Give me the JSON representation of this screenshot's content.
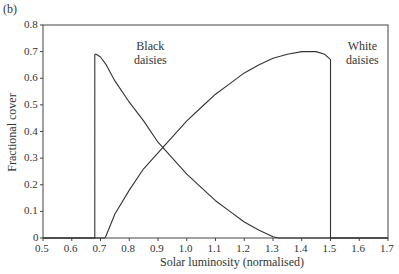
{
  "panel_label": "(b)",
  "chart_data": {
    "type": "line",
    "title": "",
    "xlabel": "Solar luminosity (normalised)",
    "ylabel": "Fractional cover",
    "xlim": [
      0.5,
      1.7
    ],
    "ylim": [
      0,
      0.8
    ],
    "xticks": [
      "0.5",
      "0.6",
      "0.7",
      "0.8",
      "0.9",
      "1.0",
      "1.1",
      "1.2",
      "1.3",
      "1.4",
      "1.5",
      "1.6",
      "1.7"
    ],
    "yticks": [
      "0",
      "0.1",
      "0.2",
      "0.3",
      "0.4",
      "0.5",
      "0.6",
      "0.7",
      "0.8"
    ],
    "grid": false,
    "legend": "inline annotations",
    "series": [
      {
        "name": "Black daisies",
        "x": [
          0.5,
          0.68,
          0.68,
          0.685,
          0.7,
          0.72,
          0.75,
          0.8,
          0.85,
          0.9,
          0.95,
          1.0,
          1.05,
          1.1,
          1.15,
          1.2,
          1.25,
          1.3,
          1.32,
          1.7
        ],
        "y": [
          0,
          0,
          0.69,
          0.69,
          0.68,
          0.65,
          0.59,
          0.51,
          0.44,
          0.36,
          0.3,
          0.24,
          0.19,
          0.14,
          0.1,
          0.06,
          0.03,
          0.005,
          0,
          0
        ]
      },
      {
        "name": "White daisies",
        "x": [
          0.5,
          0.715,
          0.72,
          0.75,
          0.8,
          0.85,
          0.9,
          0.95,
          1.0,
          1.05,
          1.1,
          1.15,
          1.2,
          1.25,
          1.3,
          1.35,
          1.4,
          1.45,
          1.48,
          1.5,
          1.5,
          1.7
        ],
        "y": [
          0,
          0,
          0.01,
          0.09,
          0.18,
          0.26,
          0.32,
          0.38,
          0.44,
          0.49,
          0.54,
          0.58,
          0.62,
          0.65,
          0.675,
          0.69,
          0.7,
          0.7,
          0.69,
          0.67,
          0,
          0
        ]
      }
    ],
    "annotations": [
      {
        "text": "Black\ndaisies",
        "x": 0.82,
        "y": 0.68
      },
      {
        "text": "White\ndaisies",
        "x": 1.6,
        "y": 0.68
      }
    ]
  },
  "annotations": {
    "black_line1": "Black",
    "black_line2": "daisies",
    "white_line1": "White",
    "white_line2": "daisies"
  }
}
